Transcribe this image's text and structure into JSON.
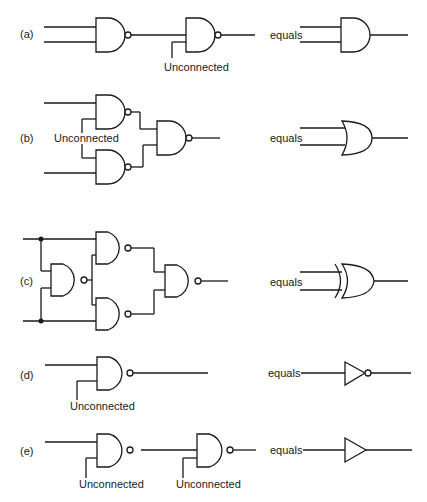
{
  "figure": {
    "colors": {
      "ink": "#1a1a1a",
      "background": "#ffffff"
    },
    "rows": [
      {
        "id": "a",
        "label": "(a)",
        "unconnected_labels": [
          "Unconnected"
        ],
        "equals_label": "equals",
        "equivalent_gate": "AND",
        "description": "NAND followed by NAND with tied inputs (inverter)"
      },
      {
        "id": "b",
        "label": "(b)",
        "unconnected_labels": [
          "Unconnected"
        ],
        "equals_label": "equals",
        "equivalent_gate": "OR",
        "description": "Two NAND inverters feeding a NAND"
      },
      {
        "id": "c",
        "label": "(c)",
        "unconnected_labels": [],
        "equals_label": "equals",
        "equivalent_gate": "XOR",
        "description": "Four NAND gates forming XOR"
      },
      {
        "id": "d",
        "label": "(d)",
        "unconnected_labels": [
          "Unconnected"
        ],
        "equals_label": "equals",
        "equivalent_gate": "NOT",
        "description": "NAND with tied inputs"
      },
      {
        "id": "e",
        "label": "(e)",
        "unconnected_labels": [
          "Unconnected",
          "Unconnected"
        ],
        "equals_label": "equals",
        "equivalent_gate": "BUFFER",
        "description": "Two NAND inverters in series"
      }
    ]
  }
}
